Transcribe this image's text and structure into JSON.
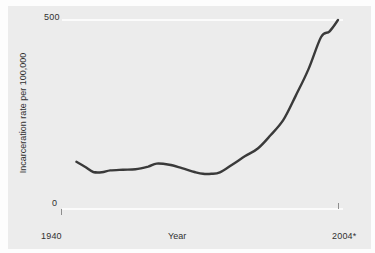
{
  "chart_data": {
    "type": "line",
    "title": "",
    "xlabel": "Year",
    "ylabel": "Incarceration rate per 100,000",
    "xlim": [
      1940,
      2004
    ],
    "ylim": [
      0,
      500
    ],
    "x_tick_labels": [
      "1940",
      "2004*"
    ],
    "y_tick_labels": [
      "0",
      "500"
    ],
    "grid": true,
    "grid_lines": [
      "0",
      "500"
    ],
    "legend": null,
    "footnote_marker": "*",
    "series": [
      {
        "name": "Incarceration rate per 100,000",
        "color": "#3a3a3a",
        "x": [
          1942,
          1944,
          1946,
          1948,
          1950,
          1953,
          1956,
          1959,
          1961,
          1964,
          1967,
          1970,
          1972,
          1974,
          1976,
          1979,
          1982,
          1985,
          1988,
          1991,
          1994,
          1997,
          2000,
          2002,
          2004
        ],
        "y": [
          125,
          112,
          98,
          97,
          102,
          104,
          105,
          112,
          120,
          117,
          108,
          98,
          93,
          93,
          97,
          118,
          140,
          160,
          195,
          235,
          300,
          370,
          455,
          470,
          500
        ]
      }
    ]
  },
  "axes": {
    "y_top_label": "500",
    "y_bottom_label": "0",
    "x_start_label": "1940",
    "x_end_label": "2004*",
    "x_axis_title": "Year",
    "y_axis_title": "Incarceration rate per 100,000"
  },
  "colors": {
    "panel_background": "#ececec",
    "page_background": "#fdfdfd",
    "line": "#3a3a3a",
    "gridline": "#fbfbfb",
    "text": "#303030",
    "tick": "#8d8d8d"
  }
}
